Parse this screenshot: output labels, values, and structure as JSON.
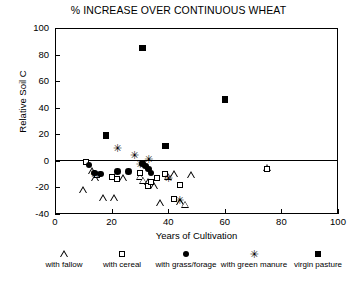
{
  "chart_data": {
    "type": "scatter",
    "title": "% INCREASE OVER CONTINUOUS WHEAT",
    "xlabel": "Years of Cultivation",
    "ylabel": "Relative Soil C",
    "xlim": [
      0,
      100
    ],
    "ylim": [
      -40,
      100
    ],
    "xticks": [
      0,
      20,
      40,
      60,
      80,
      100
    ],
    "yticks": [
      -40,
      -20,
      0,
      20,
      40,
      60,
      80,
      100
    ],
    "grid": false,
    "reference_line": 0,
    "legend_position": "below-axes",
    "series": [
      {
        "name": "with fallow",
        "marker": "open-triangle",
        "points": [
          [
            10,
            -22
          ],
          [
            13,
            -8
          ],
          [
            14,
            -13
          ],
          [
            17,
            -28
          ],
          [
            21,
            -28
          ],
          [
            24,
            -13
          ],
          [
            30,
            -12
          ],
          [
            31,
            -15
          ],
          [
            33,
            -16
          ],
          [
            35,
            -19
          ],
          [
            37,
            -32
          ],
          [
            40,
            -12
          ],
          [
            42,
            -10
          ],
          [
            44,
            -31
          ],
          [
            46,
            -33
          ],
          [
            48,
            -11
          ],
          [
            75,
            -5
          ]
        ]
      },
      {
        "name": "with cereal",
        "marker": "open-square",
        "points": [
          [
            11,
            -1
          ],
          [
            15,
            -11
          ],
          [
            20,
            -12
          ],
          [
            22,
            -14
          ],
          [
            30,
            -9
          ],
          [
            33,
            -19
          ],
          [
            34,
            -16
          ],
          [
            36,
            -13
          ],
          [
            39,
            -10
          ],
          [
            42,
            -29
          ],
          [
            44,
            -18
          ],
          [
            75,
            -6
          ]
        ]
      },
      {
        "name": "with grass/forage",
        "marker": "filled-circle",
        "points": [
          [
            12,
            -3
          ],
          [
            14,
            -9
          ],
          [
            16,
            -10
          ],
          [
            22,
            -8
          ],
          [
            26,
            -8
          ],
          [
            31,
            -2
          ],
          [
            32,
            -4
          ],
          [
            33,
            -6
          ],
          [
            34,
            -9
          ]
        ]
      },
      {
        "name": "with green manure",
        "marker": "asterisk",
        "points": [
          [
            14,
            -10
          ],
          [
            22,
            9
          ],
          [
            28,
            4
          ],
          [
            30,
            -3
          ],
          [
            33,
            1
          ],
          [
            40,
            -13
          ],
          [
            44,
            -30
          ]
        ]
      },
      {
        "name": "virgin pasture",
        "marker": "filled-square",
        "points": [
          [
            18,
            19
          ],
          [
            31,
            85
          ],
          [
            39,
            11
          ],
          [
            60,
            46
          ],
          [
            98,
            -40
          ]
        ]
      }
    ]
  },
  "legend": {
    "items": [
      {
        "label": "with fallow",
        "marker": "open-triangle"
      },
      {
        "label": "with cereal",
        "marker": "open-square"
      },
      {
        "label": "with grass/forage",
        "marker": "filled-circle"
      },
      {
        "label": "with green manure",
        "marker": "asterisk"
      },
      {
        "label": "virgin pasture",
        "marker": "filled-square"
      }
    ]
  }
}
